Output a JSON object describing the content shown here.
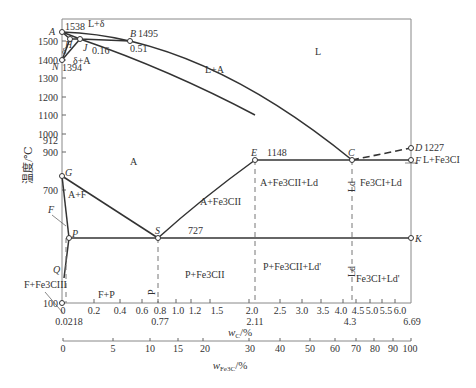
{
  "diagram": {
    "y_axis": {
      "label": "温度/℃",
      "ticks": [
        {
          "value": 1500,
          "label": "1500"
        },
        {
          "value": 1400,
          "label": "1400"
        },
        {
          "value": 1300,
          "label": "1300"
        },
        {
          "value": 1200,
          "label": "1200"
        },
        {
          "value": 1100,
          "label": "1100"
        },
        {
          "value": 1000,
          "label": "1000"
        },
        {
          "value": 900,
          "label": "900"
        },
        {
          "value": 700,
          "label": "700"
        },
        {
          "value": 100,
          "label": "100"
        }
      ],
      "extra_labels": {
        "912": "912",
        "1538": "1538",
        "1394": "1394"
      }
    },
    "x_axis_c": {
      "label": "wC/%",
      "label_main": "w",
      "label_sub": "C",
      "label_unit": "/%",
      "ticks": [
        "0",
        "0.2",
        "0.4",
        "0.6",
        "0.8",
        "1.0",
        "1.2",
        "1.5",
        "2.0",
        "2.5",
        "3.0",
        "3.5",
        "4.0",
        "4.5",
        "5.0",
        "5.5",
        "6.0"
      ],
      "special": [
        "0.0218",
        "0.77",
        "2.11",
        "4.3",
        "6.69"
      ]
    },
    "x_axis_fe3c": {
      "label": "wFe3C/%",
      "label_main": "w",
      "label_sub": "Fe3C",
      "label_unit": "/%",
      "ticks": [
        "0",
        "5",
        "10",
        "15",
        "20",
        "30",
        "40",
        "50",
        "60",
        "70",
        "80",
        "90",
        "100"
      ]
    },
    "points": {
      "A": {
        "name": "A",
        "temp": "1538"
      },
      "B": {
        "name": "B",
        "temp": "1495",
        "c": "0.51"
      },
      "H": {
        "name": "H"
      },
      "J": {
        "name": "J",
        "c": "0.16"
      },
      "N": {
        "name": "N",
        "temp": "1394"
      },
      "D": {
        "name": "D",
        "temp": "1227"
      },
      "E": {
        "name": "E",
        "temp": "1148"
      },
      "C": {
        "name": "C"
      },
      "F": {
        "name": "F"
      },
      "G": {
        "name": "G",
        "temp": "912"
      },
      "S": {
        "name": "S",
        "temp": "727"
      },
      "P": {
        "name": "P"
      },
      "K": {
        "name": "K"
      },
      "Q": {
        "name": "Q"
      },
      "F2": {
        "name": "F"
      }
    },
    "regions": {
      "L": "L",
      "L_delta": "L+δ",
      "delta": "δ",
      "delta_A": "δ+A",
      "L_A": "L+A",
      "A": "A",
      "A_F": "A+F",
      "F_Fe3CIII": "F+Fe3CIII",
      "F_P": "F+P",
      "P_vertical": "P",
      "A_Fe3CII": "A+Fe3CII",
      "P_Fe3CII": "P+Fe3CII",
      "A_Fe3CII_Ld": "A+Fe3CII+Ld",
      "P_Fe3CII_Ldp": "P+Fe3CII+Ld'",
      "Fe3CI_Ld": "Fe3CI+Ld",
      "Fe3CI_Ldp": "Fe3CI+Ld'",
      "L_Fe3CI": "L+Fe3CI",
      "Ld_vertical_upper": "Ld",
      "Ld_vertical_lower": "Ld"
    },
    "labels": {
      "t1148": "1148",
      "t727": "727"
    }
  }
}
